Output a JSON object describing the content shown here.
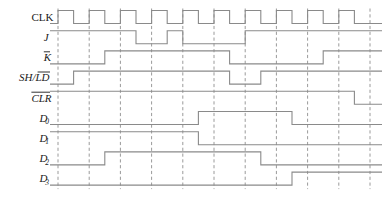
{
  "diagram": {
    "type": "digital-timing-diagram",
    "title": "",
    "width": 382,
    "height": 207,
    "background_color": "#ffffff",
    "waveform_color": "#8a8a8a",
    "gridline_color": "#9a9a9a",
    "label_color": "#1a1a1a",
    "time": {
      "origin_x": 58,
      "unit_px": 31.2,
      "units_total": 10.4,
      "gridline_positions": [
        0,
        1,
        2,
        3,
        4,
        5,
        6,
        7,
        8,
        9,
        10
      ],
      "gridline_style": "dashed"
    },
    "geometry": {
      "label_right_x": 50,
      "row_height": 20.2,
      "first_row_center_y": 17,
      "level_amplitude_px": 13
    },
    "signals": [
      {
        "name": "CLK",
        "label_text": "CLK",
        "label_style": "roman",
        "overbar": null,
        "subscript": null,
        "row_index": 0,
        "initial_level": 0,
        "transitions": [
          {
            "t": 0.0,
            "level": 1
          },
          {
            "t": 0.5,
            "level": 0
          },
          {
            "t": 1.0,
            "level": 1
          },
          {
            "t": 1.5,
            "level": 0
          },
          {
            "t": 2.0,
            "level": 1
          },
          {
            "t": 2.5,
            "level": 0
          },
          {
            "t": 3.0,
            "level": 1
          },
          {
            "t": 3.5,
            "level": 0
          },
          {
            "t": 4.0,
            "level": 1
          },
          {
            "t": 4.5,
            "level": 0
          },
          {
            "t": 5.0,
            "level": 1
          },
          {
            "t": 5.5,
            "level": 0
          },
          {
            "t": 6.0,
            "level": 1
          },
          {
            "t": 6.5,
            "level": 0
          },
          {
            "t": 7.0,
            "level": 1
          },
          {
            "t": 7.5,
            "level": 0
          },
          {
            "t": 8.0,
            "level": 1
          },
          {
            "t": 8.5,
            "level": 0
          },
          {
            "t": 9.0,
            "level": 1
          },
          {
            "t": 9.5,
            "level": 0
          }
        ]
      },
      {
        "name": "J",
        "label_text": "J",
        "label_style": "italic",
        "overbar": null,
        "subscript": null,
        "row_index": 1,
        "initial_level": 1,
        "transitions": [
          {
            "t": 2.5,
            "level": 0
          },
          {
            "t": 3.5,
            "level": 1
          },
          {
            "t": 4.0,
            "level": 0
          },
          {
            "t": 6.0,
            "level": 1
          }
        ]
      },
      {
        "name": "K",
        "label_text": "K",
        "label_style": "italic",
        "overbar": "K",
        "subscript": null,
        "row_index": 2,
        "initial_level": 0,
        "transitions": [
          {
            "t": 1.5,
            "level": 1
          },
          {
            "t": 5.5,
            "level": 0
          },
          {
            "t": 8.5,
            "level": 1
          }
        ]
      },
      {
        "name": "SH/LD",
        "label_text": "SH/LD",
        "label_style": "italic",
        "overbar": "LD",
        "subscript": null,
        "row_index": 3,
        "initial_level": 0,
        "transitions": [
          {
            "t": 0.5,
            "level": 1
          },
          {
            "t": 5.5,
            "level": 0
          },
          {
            "t": 6.5,
            "level": 1
          }
        ]
      },
      {
        "name": "CLR",
        "label_text": "CLR",
        "label_style": "italic",
        "overbar": "CLR",
        "subscript": null,
        "row_index": 4,
        "initial_level": 1,
        "transitions": [
          {
            "t": 9.5,
            "level": 0
          }
        ]
      },
      {
        "name": "D0",
        "label_text": "D",
        "label_style": "italic",
        "overbar": null,
        "subscript": "0",
        "row_index": 5,
        "initial_level": 0,
        "transitions": [
          {
            "t": 4.5,
            "level": 1
          },
          {
            "t": 7.5,
            "level": 0
          }
        ]
      },
      {
        "name": "D1",
        "label_text": "D",
        "label_style": "italic",
        "overbar": null,
        "subscript": "1",
        "row_index": 6,
        "initial_level": 1,
        "transitions": [
          {
            "t": 4.5,
            "level": 0
          }
        ]
      },
      {
        "name": "D2",
        "label_text": "D",
        "label_style": "italic",
        "overbar": null,
        "subscript": "2",
        "row_index": 7,
        "initial_level": 0,
        "transitions": [
          {
            "t": 1.5,
            "level": 1
          },
          {
            "t": 6.5,
            "level": 0
          }
        ]
      },
      {
        "name": "D3",
        "label_text": "D",
        "label_style": "italic",
        "overbar": null,
        "subscript": "3",
        "row_index": 8,
        "initial_level": 0,
        "transitions": [
          {
            "t": 7.5,
            "level": 1
          }
        ]
      }
    ]
  }
}
